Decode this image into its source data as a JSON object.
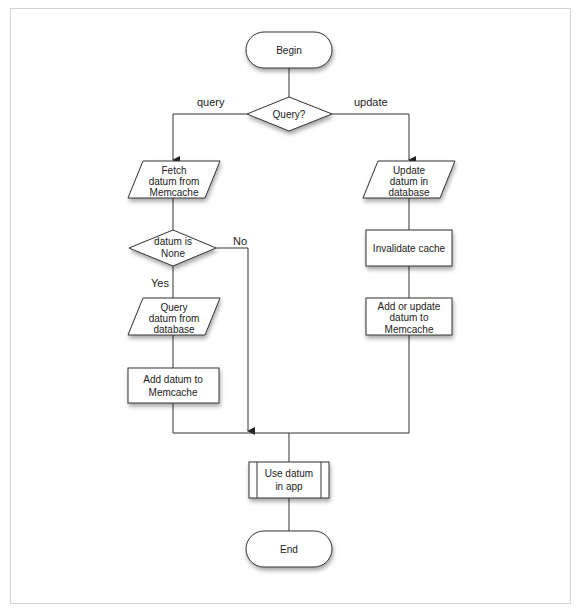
{
  "diagram": {
    "nodes": {
      "begin": {
        "label": "Begin",
        "shape": "terminator"
      },
      "query_decision": {
        "label": "Query?",
        "shape": "decision"
      },
      "fetch": {
        "lines": [
          "Fetch",
          "datum from",
          "Memcache"
        ],
        "shape": "data"
      },
      "datum_none": {
        "lines": [
          "datum is",
          "None"
        ],
        "shape": "decision"
      },
      "query_db": {
        "lines": [
          "Query",
          "datum from",
          "database"
        ],
        "shape": "data"
      },
      "add_memcache": {
        "lines": [
          "Add datum to",
          "Memcache"
        ],
        "shape": "process"
      },
      "update_db": {
        "lines": [
          "Update",
          "datum in",
          "database"
        ],
        "shape": "data"
      },
      "invalidate": {
        "label": "Invalidate cache",
        "shape": "process"
      },
      "add_update_memcache": {
        "lines": [
          "Add or update",
          "datum to",
          "Memcache"
        ],
        "shape": "process"
      },
      "use_datum": {
        "lines": [
          "Use datum",
          "in app"
        ],
        "shape": "predefined-process"
      },
      "end": {
        "label": "End",
        "shape": "terminator"
      }
    },
    "edge_labels": {
      "query": "query",
      "update": "update",
      "no": "No",
      "yes": "Yes"
    },
    "edges": [
      [
        "begin",
        "query_decision"
      ],
      [
        "query_decision",
        "fetch",
        "query"
      ],
      [
        "query_decision",
        "update_db",
        "update"
      ],
      [
        "fetch",
        "datum_none"
      ],
      [
        "datum_none",
        "query_db",
        "Yes"
      ],
      [
        "datum_none",
        "use_datum",
        "No"
      ],
      [
        "query_db",
        "add_memcache"
      ],
      [
        "add_memcache",
        "use_datum"
      ],
      [
        "update_db",
        "invalidate"
      ],
      [
        "invalidate",
        "add_update_memcache"
      ],
      [
        "add_update_memcache",
        "use_datum"
      ],
      [
        "use_datum",
        "end"
      ]
    ],
    "colors": {
      "stroke": "#333333",
      "fill": "#ffffff",
      "frame": "#d4d4d4"
    }
  }
}
